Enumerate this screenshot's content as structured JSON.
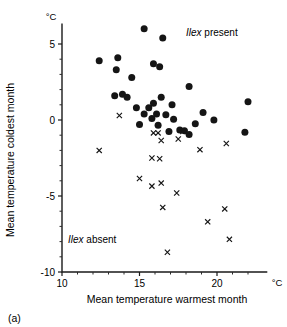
{
  "figure": {
    "panel_label": "(a)",
    "x_unit": "°C",
    "y_unit": "°C",
    "xlabel": "Mean temperature warmest month",
    "ylabel": "Mean temperature coldest month",
    "annotation_present_italic": "Ilex",
    "annotation_present_rest": " present",
    "annotation_absent_italic": "Ilex",
    "annotation_absent_rest": " absent",
    "marker_present": "filled-circle",
    "marker_absent": "cross",
    "ink_color": "#151515"
  },
  "chart_data": {
    "type": "scatter",
    "title": "",
    "xlabel": "Mean temperature warmest month",
    "ylabel": "Mean temperature coldest month",
    "xunit": "°C",
    "yunit": "°C",
    "xlim": [
      10,
      23.2
    ],
    "ylim": [
      -10,
      6.3
    ],
    "xticks": [
      10,
      15,
      20
    ],
    "xticklabels": [
      "10",
      "15",
      "20"
    ],
    "xminorticks": [
      11,
      12,
      13,
      14,
      16,
      17,
      18,
      19,
      21,
      22
    ],
    "yticks": [
      5,
      0,
      -5,
      -10
    ],
    "yticklabels": [
      "5",
      "0",
      "-5",
      "-10"
    ],
    "yminorticks": [
      4,
      3,
      2,
      1,
      -1,
      -2,
      -3,
      -4,
      -6,
      -7,
      -8,
      -9
    ],
    "grid": false,
    "legend_position": "inline-annotations",
    "series": [
      {
        "name": "Ilex present",
        "marker": "filled-circle",
        "color": "#151515",
        "points": [
          [
            15.3,
            6.0
          ],
          [
            16.5,
            5.4
          ],
          [
            12.4,
            3.9
          ],
          [
            13.6,
            4.1
          ],
          [
            15.9,
            3.7
          ],
          [
            13.5,
            3.3
          ],
          [
            16.3,
            3.5
          ],
          [
            14.5,
            2.8
          ],
          [
            18.2,
            2.2
          ],
          [
            13.4,
            1.6
          ],
          [
            13.9,
            1.7
          ],
          [
            14.2,
            1.5
          ],
          [
            16.4,
            1.5
          ],
          [
            15.9,
            1.1
          ],
          [
            17.1,
            1.0
          ],
          [
            14.8,
            0.8
          ],
          [
            15.6,
            0.8
          ],
          [
            22.0,
            1.2
          ],
          [
            15.3,
            0.4
          ],
          [
            16.1,
            0.4
          ],
          [
            16.7,
            0.35
          ],
          [
            19.1,
            0.5
          ],
          [
            15.8,
            0.1
          ],
          [
            17.2,
            0.05
          ],
          [
            19.8,
            0.0
          ],
          [
            15.0,
            -0.3
          ],
          [
            16.2,
            -0.35
          ],
          [
            18.6,
            -0.25
          ],
          [
            16.9,
            -0.75
          ],
          [
            17.6,
            -0.65
          ],
          [
            17.9,
            -0.7
          ],
          [
            18.2,
            -0.95
          ],
          [
            21.8,
            -0.8
          ]
        ]
      },
      {
        "name": "Ilex absent",
        "marker": "cross",
        "color": "#151515",
        "points": [
          [
            13.7,
            0.3
          ],
          [
            15.9,
            -0.85
          ],
          [
            16.2,
            -0.85
          ],
          [
            17.8,
            -0.75
          ],
          [
            16.4,
            -1.35
          ],
          [
            17.5,
            -1.25
          ],
          [
            12.4,
            -2.0
          ],
          [
            18.9,
            -1.95
          ],
          [
            20.6,
            -1.55
          ],
          [
            15.8,
            -2.5
          ],
          [
            16.3,
            -2.55
          ],
          [
            15.0,
            -3.85
          ],
          [
            15.8,
            -4.35
          ],
          [
            16.4,
            -4.15
          ],
          [
            17.4,
            -4.8
          ],
          [
            16.5,
            -5.75
          ],
          [
            20.5,
            -5.85
          ],
          [
            19.4,
            -6.7
          ],
          [
            20.8,
            -7.85
          ],
          [
            16.8,
            -8.7
          ]
        ]
      }
    ]
  }
}
